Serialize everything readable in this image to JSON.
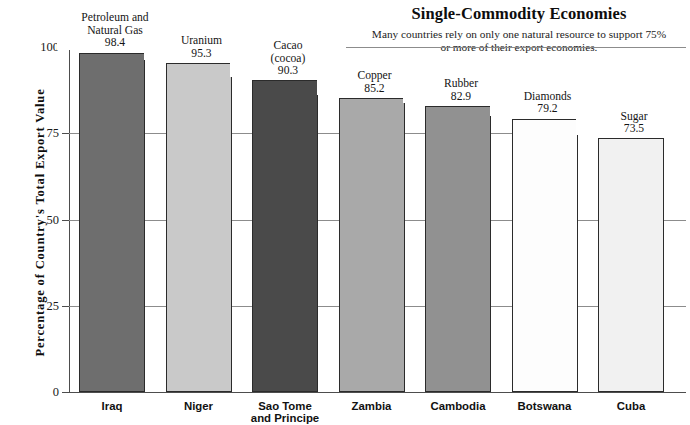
{
  "chart_data": {
    "type": "bar",
    "title": "Single-Commodity Economies",
    "subtitle": "Many countries rely on only one natural resource to support 75% or more of their export economies.",
    "xlabel": "",
    "ylabel": "Percentage of Country's Total Export Value",
    "ylim": [
      0,
      100
    ],
    "yticks": [
      "0",
      "25",
      "50",
      "75",
      "100"
    ],
    "ytick_values": [
      0,
      25,
      50,
      75,
      100
    ],
    "grid": true,
    "legend": "none",
    "categories": [
      "Iraq",
      "Niger",
      "Sao Tome\nand Principe",
      "Zambia",
      "Cambodia",
      "Botswana",
      "Cuba"
    ],
    "values": [
      98.4,
      95.3,
      90.3,
      85.2,
      82.9,
      79.2,
      73.5
    ],
    "commodities": [
      "Petroleum and\nNatural Gas",
      "Uranium",
      "Cacao\n(cocoa)",
      "Copper",
      "Rubber",
      "Diamonds",
      "Sugar"
    ],
    "bar_labels": [
      "Petroleum and\nNatural Gas\n98.4",
      "Uranium\n95.3",
      "Cacao\n(cocoa)\n90.3",
      "Copper\n85.2",
      "Rubber\n82.9",
      "Diamonds\n79.2",
      "Sugar\n73.5"
    ],
    "bar_colors": [
      "#6e6e6e",
      "#c9c9c9",
      "#4a4a4a",
      "#a9a9a9",
      "#919191",
      "#fdfdfd",
      "#f1f1f1"
    ],
    "bar_edge_color": "#2b2b2b",
    "axis_color": "#4d4d4d",
    "grid_color": "#8c8c8c"
  }
}
